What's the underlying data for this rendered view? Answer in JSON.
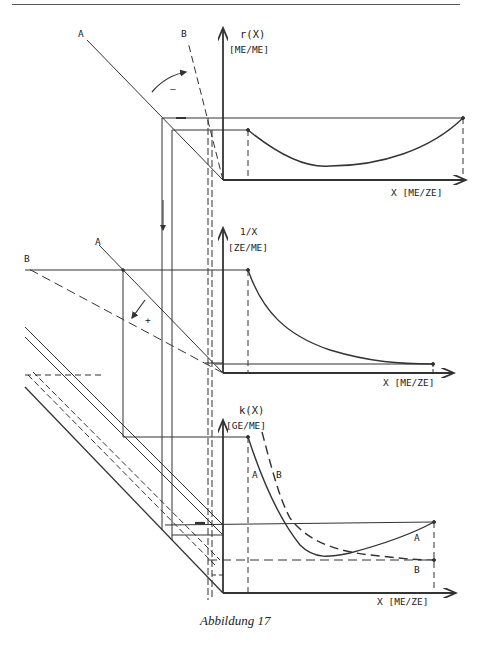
{
  "header": {
    "page_number": ""
  },
  "figure": {
    "caption": "Abbildung 17",
    "top_chart": {
      "y_label": "r(X)",
      "y_unit": "[ME/ME]",
      "x_label": "X [ME/ZE]",
      "line_A_label": "A",
      "line_B_label": "B",
      "rotation_sign": "–"
    },
    "middle_chart": {
      "y_label": "1/X",
      "y_unit": "[ZE/ME]",
      "x_label": "X [ME/ZE]",
      "line_A_label": "A",
      "line_B_label": "B",
      "rotation_sign": "+"
    },
    "bottom_chart": {
      "y_label": "k(X)",
      "y_unit": "[GE/ME]",
      "x_label": "X [ME/ZE]",
      "curve_A_label": "A",
      "curve_B_label": "B",
      "curve_A_label_right": "A",
      "curve_B_label_right": "B"
    }
  }
}
